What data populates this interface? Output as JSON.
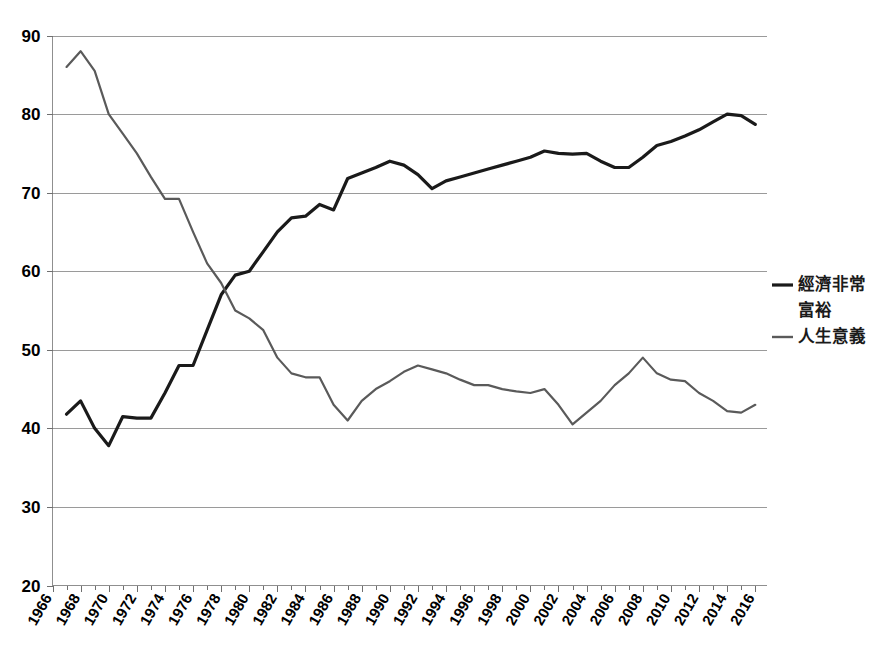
{
  "chart_data": {
    "type": "line",
    "title": "",
    "subtitle": "",
    "xlabel": "",
    "ylabel": "",
    "xlim": [
      1966,
      2016
    ],
    "ylim": [
      20,
      90
    ],
    "grid": true,
    "legend_position": "right",
    "y_ticks": [
      20,
      30,
      40,
      50,
      60,
      70,
      80,
      90
    ],
    "x_ticks": [
      1966,
      1968,
      1970,
      1972,
      1974,
      1976,
      1978,
      1980,
      1982,
      1984,
      1986,
      1988,
      1990,
      1992,
      1994,
      1996,
      1998,
      2000,
      2002,
      2004,
      2006,
      2008,
      2010,
      2012,
      2014,
      2016
    ],
    "x_tick_labels": [
      "1966",
      "1968",
      "1970",
      "1972",
      "1974",
      "1976",
      "1978",
      "1980",
      "1982",
      "1984",
      "1986",
      "1988",
      "1990",
      "1992",
      "1994",
      "1996",
      "1998",
      "2000",
      "2002",
      "2004",
      "2006",
      "2008",
      "2010",
      "2012",
      "2014",
      "2016"
    ],
    "y_tick_labels": [
      "20",
      "30",
      "40",
      "50",
      "60",
      "70",
      "80",
      "90"
    ],
    "x": [
      1967,
      1968,
      1969,
      1970,
      1971,
      1972,
      1973,
      1974,
      1975,
      1976,
      1977,
      1978,
      1979,
      1980,
      1981,
      1982,
      1983,
      1984,
      1985,
      1986,
      1987,
      1988,
      1989,
      1990,
      1991,
      1992,
      1993,
      1994,
      1995,
      1996,
      1997,
      1998,
      1999,
      2000,
      2001,
      2002,
      2003,
      2004,
      2005,
      2006,
      2007,
      2008,
      2009,
      2010,
      2011,
      2012,
      2013,
      2014,
      2015,
      2016
    ],
    "series": [
      {
        "name": "經濟非常富裕",
        "color": "#1a1a1a",
        "width": 3.2,
        "values": [
          41.8,
          43.5,
          40.0,
          37.8,
          41.5,
          41.3,
          41.3,
          44.5,
          48.0,
          48.0,
          52.5,
          57.0,
          59.5,
          60.0,
          62.5,
          65.0,
          66.8,
          67.0,
          68.5,
          67.8,
          71.8,
          72.5,
          73.2,
          74.0,
          73.5,
          72.3,
          70.5,
          71.5,
          72.0,
          72.5,
          73.0,
          73.5,
          74.0,
          74.5,
          75.3,
          75.0,
          74.9,
          75.0,
          74.0,
          73.2,
          73.2,
          74.5,
          76.0,
          76.5,
          77.2,
          78.0,
          79.0,
          80.0,
          79.8,
          78.7
        ]
      },
      {
        "name": "人生意義",
        "color": "#5a5a5a",
        "width": 2.2,
        "values": [
          86.0,
          88.0,
          85.5,
          80.0,
          77.5,
          75.0,
          72.0,
          69.2,
          69.2,
          65.0,
          61.0,
          58.5,
          55.0,
          54.0,
          52.5,
          49.0,
          47.0,
          46.5,
          46.5,
          43.0,
          41.0,
          43.5,
          45.0,
          46.0,
          47.2,
          48.0,
          47.5,
          47.0,
          46.2,
          45.5,
          45.5,
          45.0,
          44.7,
          44.5,
          45.0,
          43.0,
          40.5,
          42.0,
          43.5,
          45.5,
          47.0,
          49.0,
          47.0,
          46.2,
          46.0,
          44.5,
          43.5,
          42.2,
          42.0,
          43.0
        ]
      }
    ]
  },
  "legend": {
    "entries": [
      {
        "label_line1": "經濟非常",
        "label_line2": "富裕",
        "color": "#1a1a1a"
      },
      {
        "label_line1": "人生意義",
        "label_line2": "",
        "color": "#5a5a5a"
      }
    ]
  }
}
